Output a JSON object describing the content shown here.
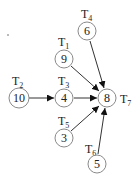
{
  "diagram": {
    "type": "task-graph",
    "nodes": [
      {
        "id": "T1",
        "label": "T",
        "sub": "1",
        "value": "9",
        "cx": 64,
        "cy": 59
      },
      {
        "id": "T2",
        "label": "T",
        "sub": "2",
        "value": "10",
        "cx": 19,
        "cy": 98
      },
      {
        "id": "T3",
        "label": "T",
        "sub": "3",
        "value": "4",
        "cx": 64,
        "cy": 98
      },
      {
        "id": "T4",
        "label": "T",
        "sub": "4",
        "value": "6",
        "cx": 87,
        "cy": 31
      },
      {
        "id": "T5",
        "label": "T",
        "sub": "5",
        "value": "3",
        "cx": 64,
        "cy": 138
      },
      {
        "id": "T6",
        "label": "T",
        "sub": "6",
        "value": "5",
        "cx": 97,
        "cy": 164
      },
      {
        "id": "T7",
        "label": "T",
        "sub": "7",
        "value": "8",
        "cx": 107,
        "cy": 98
      }
    ],
    "edges": [
      {
        "from": "T2",
        "to": "T3"
      },
      {
        "from": "T3",
        "to": "T7"
      },
      {
        "from": "T1",
        "to": "T7"
      },
      {
        "from": "T4",
        "to": "T7"
      },
      {
        "from": "T5",
        "to": "T7"
      },
      {
        "from": "T6",
        "to": "T7"
      }
    ]
  }
}
